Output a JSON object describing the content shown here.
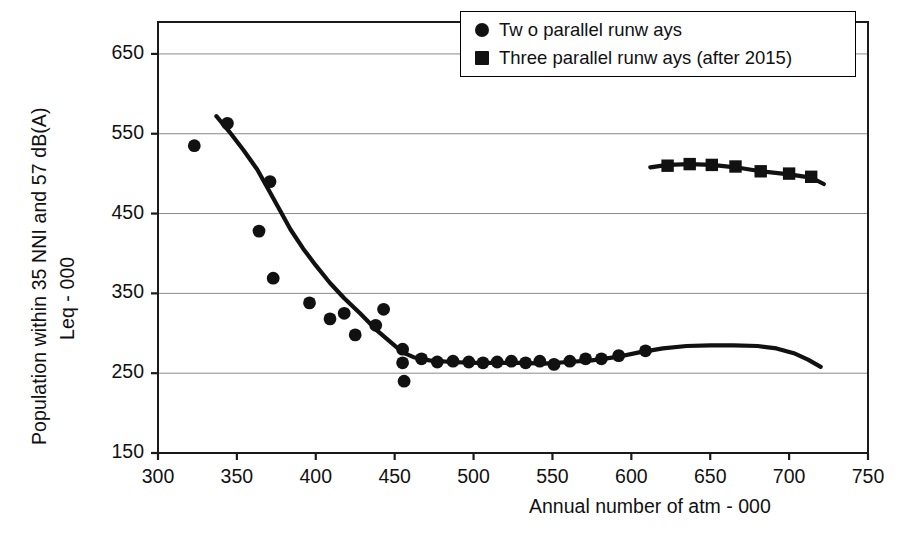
{
  "chart_data": {
    "type": "scatter",
    "title": "",
    "xlabel": "Annual number of atm - 000",
    "ylabel_line1": "Population within 35 NNI and 57 dB(A)",
    "ylabel_line2": "Leq - 000",
    "xlim": [
      300,
      750
    ],
    "ylim": [
      150,
      690
    ],
    "xticks": [
      300,
      350,
      400,
      450,
      500,
      550,
      600,
      650,
      700,
      750
    ],
    "yticks": [
      150,
      250,
      350,
      450,
      550,
      650
    ],
    "grid": "horizontal",
    "legend_position": "top-right",
    "series": [
      {
        "name": "Tw o parallel runw ays",
        "marker": "circle",
        "color": "#111111",
        "points": [
          [
            323,
            535
          ],
          [
            344,
            563
          ],
          [
            364,
            428
          ],
          [
            371,
            490
          ],
          [
            373,
            369
          ],
          [
            396,
            338
          ],
          [
            409,
            318
          ],
          [
            418,
            325
          ],
          [
            425,
            298
          ],
          [
            438,
            310
          ],
          [
            443,
            330
          ],
          [
            455,
            280
          ],
          [
            455,
            263
          ],
          [
            456,
            240
          ],
          [
            467,
            268
          ],
          [
            477,
            264
          ],
          [
            487,
            265
          ],
          [
            497,
            264
          ],
          [
            506,
            263
          ],
          [
            515,
            264
          ],
          [
            524,
            265
          ],
          [
            533,
            263
          ],
          [
            542,
            265
          ],
          [
            551,
            261
          ],
          [
            561,
            265
          ],
          [
            571,
            268
          ],
          [
            581,
            268
          ],
          [
            592,
            272
          ],
          [
            609,
            278
          ]
        ]
      },
      {
        "name": "Three parallel runw ays (after 2015)",
        "marker": "square",
        "color": "#111111",
        "points": [
          [
            623,
            510
          ],
          [
            637,
            512
          ],
          [
            651,
            511
          ],
          [
            666,
            509
          ],
          [
            682,
            503
          ],
          [
            700,
            500
          ],
          [
            714,
            496
          ]
        ]
      }
    ],
    "trend_lines": [
      {
        "name": "two-runway-trend",
        "points": [
          [
            337,
            572
          ],
          [
            345,
            553
          ],
          [
            354,
            530
          ],
          [
            363,
            505
          ],
          [
            370,
            480
          ],
          [
            377,
            455
          ],
          [
            384,
            430
          ],
          [
            392,
            406
          ],
          [
            400,
            385
          ],
          [
            409,
            363
          ],
          [
            418,
            344
          ],
          [
            428,
            325
          ],
          [
            438,
            305
          ],
          [
            448,
            288
          ],
          [
            455,
            276
          ],
          [
            462,
            270
          ],
          [
            472,
            266
          ],
          [
            486,
            264
          ],
          [
            500,
            263
          ],
          [
            515,
            263
          ],
          [
            530,
            263
          ],
          [
            545,
            262
          ],
          [
            560,
            264
          ],
          [
            575,
            266
          ],
          [
            590,
            270
          ],
          [
            605,
            276
          ],
          [
            620,
            281
          ],
          [
            635,
            284
          ],
          [
            650,
            285
          ],
          [
            665,
            285
          ],
          [
            680,
            284
          ],
          [
            692,
            281
          ],
          [
            703,
            275
          ],
          [
            712,
            267
          ],
          [
            720,
            258
          ]
        ]
      },
      {
        "name": "three-runway-trend",
        "points": [
          [
            612,
            508
          ],
          [
            623,
            511
          ],
          [
            637,
            512
          ],
          [
            651,
            511
          ],
          [
            666,
            508
          ],
          [
            682,
            503
          ],
          [
            700,
            499
          ],
          [
            714,
            495
          ],
          [
            722,
            487
          ]
        ]
      }
    ]
  },
  "legend": {
    "items": [
      {
        "label": "Tw o parallel runw ays",
        "marker": "circle"
      },
      {
        "label": "Three parallel runw ays (after 2015)",
        "marker": "square"
      }
    ]
  },
  "axes": {
    "x_tick_labels": [
      "300",
      "350",
      "400",
      "450",
      "500",
      "550",
      "600",
      "650",
      "700",
      "750"
    ],
    "y_tick_labels": [
      "650",
      "550",
      "450",
      "350",
      "250",
      "150"
    ],
    "x_title": "Annual number of atm - 000",
    "y_title_line1": "Population within 35 NNI and 57 dB(A)",
    "y_title_line2": "Leq - 000"
  },
  "colors": {
    "marker": "#111111",
    "axis": "#1a1a1a",
    "grid": "#8a8a8a",
    "background": "#ffffff"
  }
}
